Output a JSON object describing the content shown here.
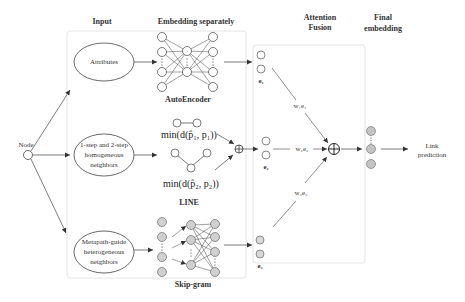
{
  "headers": {
    "input": "Input",
    "embedding": "Embedding separately",
    "attention_line1": "Attention",
    "attention_line2": "Fusion",
    "final_line1": "Final",
    "final_line2": "embedding"
  },
  "node_label": "Node",
  "inputs": {
    "attributes": "Attributes",
    "homogeneous": [
      "1-step and 2-step",
      "homogeneous",
      "neighbors"
    ],
    "metapath": [
      "Metapath-guide",
      "heterogeneous",
      "neighbors"
    ]
  },
  "models": {
    "autoencoder": "AutoEncoder",
    "line": "LINE",
    "line_formula1": "min(d(p̂₁, p₁))",
    "line_formula2": "min(d(p̂₂, p₂))",
    "skipgram": "Skip-gram"
  },
  "embeddings": {
    "e1": "e₁",
    "e2": "e₂",
    "e3": "e₃"
  },
  "weights": {
    "w1e1": "w₁e₁",
    "w2e2": "w₂e₂",
    "w3e3": "w₃e₃"
  },
  "output": [
    "Link",
    "prediction"
  ],
  "colors": {
    "gray_node": "#c8c8c8",
    "line": "#444444",
    "frame": "#e6e6e6"
  }
}
